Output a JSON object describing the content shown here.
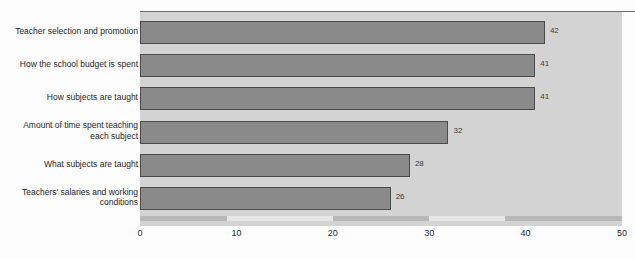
{
  "chart_data": {
    "type": "bar",
    "orientation": "horizontal",
    "title": "",
    "subtitle": "",
    "xlabel": "",
    "ylabel": "",
    "xlim": [
      0,
      50
    ],
    "xticks": [
      "0",
      "10",
      "20",
      "30",
      "40",
      "50"
    ],
    "grid": false,
    "legend": null,
    "categories": [
      "Teacher selection and promotion",
      "How the school budget is spent",
      "How subjects are taught",
      "Amount of time spent teaching\neach subject",
      "What subjects are taught",
      "Teachers' salaries and working\nconditions"
    ],
    "values": [
      42,
      41,
      41,
      32,
      28,
      26
    ],
    "value_labels": [
      "42",
      "41",
      "41",
      "32",
      "28",
      "26"
    ],
    "colors": {
      "bar_fill": "#8a8a8a",
      "bar_stroke": "#4a4a4a",
      "plot_background": "#d3d3d3",
      "page_background": "#fdfdfd",
      "top_rule": "#6a6a6a",
      "axis_band_dark": "#b8b8b8",
      "axis_band_light": "#e6e6e6",
      "text": "#262626"
    }
  }
}
